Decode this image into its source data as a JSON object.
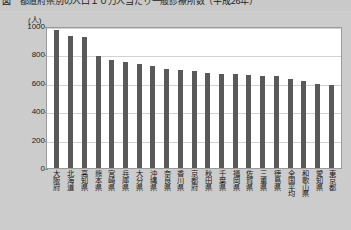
{
  "title": "図　都道府県別の人口１０万人当たり一般診療所数（平成26年）",
  "chart_data": {
    "type": "bar",
    "title": "図　都道府県別の人口１０万人当たり一般診療所数（平成26年）",
    "unit_label": "(人)",
    "xlabel": "",
    "ylabel": "",
    "ylim": [
      0,
      1000
    ],
    "yticks": [
      0,
      200,
      400,
      600,
      800,
      1000
    ],
    "ytick_labels": [
      "0",
      "200",
      "400",
      "600",
      "800",
      "1000"
    ],
    "grid": true,
    "legend": "none",
    "bar_color": "#595959",
    "categories": [
      "大阪府",
      "北海道",
      "高知県",
      "熊本県",
      "宮崎県",
      "兵庫県",
      "大分県",
      "沖縄県",
      "奈良県",
      "香川県",
      "京都府",
      "秋田県",
      "千葉県",
      "福岡県",
      "佐賀県",
      "三重県",
      "徳島県",
      "全国平均",
      "和歌山県",
      "愛知県",
      "東京都"
    ],
    "values": [
      975,
      930,
      925,
      790,
      760,
      745,
      730,
      715,
      700,
      690,
      680,
      670,
      665,
      660,
      655,
      650,
      645,
      625,
      610,
      595,
      585
    ],
    "series": [
      {
        "name": "一般診療所数",
        "values": [
          975,
          930,
          925,
          790,
          760,
          745,
          730,
          715,
          700,
          690,
          680,
          670,
          665,
          660,
          655,
          650,
          645,
          625,
          610,
          595,
          585
        ]
      }
    ]
  }
}
